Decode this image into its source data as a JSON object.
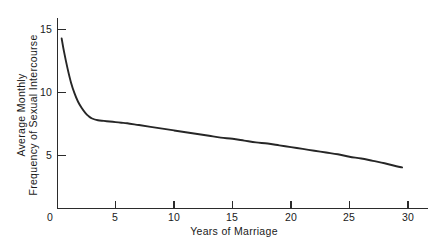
{
  "chart_data": {
    "type": "line",
    "title": "",
    "xlabel": "Years of Marriage",
    "ylabel_line1": "Average Monthly",
    "ylabel_line2": "Frequency of Sexual Intercourse",
    "xlim": [
      0,
      32
    ],
    "ylim": [
      0,
      16.2
    ],
    "grid": false,
    "legend": "none",
    "xticks": [
      0,
      5,
      10,
      15,
      20,
      25,
      30
    ],
    "xtick_labels": [
      "0",
      "5",
      "10",
      "15",
      "20",
      "25",
      "30"
    ],
    "yticks": [
      5,
      10,
      15
    ],
    "ytick_labels": [
      "5",
      "10",
      "15"
    ],
    "series": [
      {
        "name": "Average monthly frequency of sexual intercourse",
        "x": [
          0.4,
          0.6,
          0.9,
          1.2,
          1.5,
          1.8,
          2.1,
          2.4,
          2.7,
          3.0,
          3.5,
          4.0,
          4.5,
          5.0,
          5.5,
          6.0,
          7.0,
          8.0,
          9.0,
          10.0,
          11.0,
          12.0,
          13.0,
          14.0,
          15.0,
          16.0,
          17.0,
          18.0,
          19.0,
          20.0,
          21.0,
          22.0,
          23.0,
          24.0,
          25.0,
          26.0,
          27.0,
          28.0,
          29.0,
          29.5
        ],
        "y": [
          14.2,
          13.1,
          11.7,
          10.5,
          9.6,
          8.9,
          8.4,
          8.0,
          7.7,
          7.5,
          7.35,
          7.3,
          7.25,
          7.2,
          7.15,
          7.1,
          6.95,
          6.8,
          6.65,
          6.5,
          6.35,
          6.2,
          6.05,
          5.9,
          5.8,
          5.65,
          5.5,
          5.4,
          5.25,
          5.1,
          4.95,
          4.8,
          4.65,
          4.5,
          4.3,
          4.15,
          3.95,
          3.75,
          3.5,
          3.4
        ]
      }
    ],
    "axis_pixel_geometry": {
      "x0_px": 57,
      "x30_px": 408,
      "x_axis_end_px": 428,
      "y0_px": 208,
      "y5_px": 155,
      "y10_px": 92,
      "y15_px": 29,
      "y_axis_top_px": 18
    }
  }
}
